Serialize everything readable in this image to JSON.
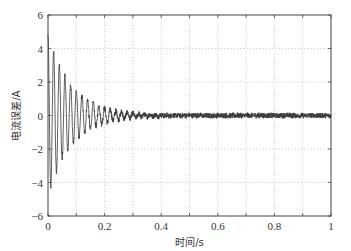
{
  "chart_data": {
    "type": "line",
    "title": "",
    "xlabel": "时间/s",
    "ylabel": "电流误差/A",
    "xlim": [
      0,
      1
    ],
    "ylim": [
      -6,
      6
    ],
    "xticks": [
      0,
      0.2,
      0.4,
      0.6,
      0.8,
      1
    ],
    "xtick_labels": [
      "0",
      "0.2",
      "0.4",
      "0.6",
      "0.8",
      "1"
    ],
    "x_minor_grid": [
      0.1,
      0.3,
      0.5,
      0.7,
      0.9
    ],
    "yticks": [
      -6,
      -4,
      -2,
      0,
      2,
      4,
      6
    ],
    "ytick_labels": [
      "-6",
      "-4",
      "-2",
      "0",
      "2",
      "4",
      "6"
    ],
    "grid": true,
    "grid_style": "dotted",
    "legend": "none",
    "line_color": "#3a3a3a",
    "series": [
      {
        "name": "电流误差",
        "description": "damped oscillation approx 50 Hz decaying from about ±4.8 A at t=0 to about ±0.3 A by t≈0.3 s, then residual noise about ±0.2 A until t=1 s",
        "model": {
          "frequency_hz": 50,
          "initial_amplitude": 4.8,
          "decay_time_constant_s": 0.085,
          "residual_noise_amplitude": 0.18,
          "sample_step_s": 0.001
        },
        "key_points": [
          {
            "x": 0.0,
            "y": 4.8
          },
          {
            "x": 0.01,
            "y": -4.6
          },
          {
            "x": 0.02,
            "y": 4.0
          },
          {
            "x": 0.03,
            "y": -3.8
          },
          {
            "x": 0.04,
            "y": 3.0
          },
          {
            "x": 0.05,
            "y": -2.9
          },
          {
            "x": 0.06,
            "y": 2.5
          },
          {
            "x": 0.07,
            "y": -2.3
          },
          {
            "x": 0.1,
            "y": 1.5
          },
          {
            "x": 0.15,
            "y": 0.9
          },
          {
            "x": 0.2,
            "y": 0.5
          },
          {
            "x": 0.3,
            "y": 0.2
          },
          {
            "x": 0.5,
            "y": 0.15
          },
          {
            "x": 1.0,
            "y": 0.1
          }
        ]
      }
    ]
  }
}
